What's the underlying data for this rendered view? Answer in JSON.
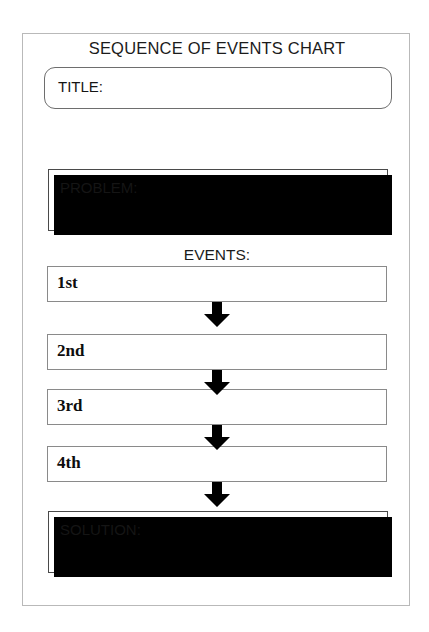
{
  "document": {
    "heading": "SEQUENCE OF EVENTS CHART",
    "background_color": "#ffffff",
    "frame_border_color": "#b9b9b9",
    "ink_color": "#000000"
  },
  "title_field": {
    "label": "TITLE:",
    "value": "",
    "placeholder": ""
  },
  "problem_field": {
    "label": "PROBLEM:",
    "value": "",
    "placeholder": ""
  },
  "events_section": {
    "label": "EVENTS:",
    "items": [
      {
        "ordinal": "1st",
        "value": "",
        "placeholder": ""
      },
      {
        "ordinal": "2nd",
        "value": "",
        "placeholder": ""
      },
      {
        "ordinal": "3rd",
        "value": "",
        "placeholder": ""
      },
      {
        "ordinal": "4th",
        "value": "",
        "placeholder": ""
      }
    ],
    "connector_icon": "arrow-down-icon",
    "connector_count": 4
  },
  "solution_field": {
    "label": "SOLUTION:",
    "value": "",
    "placeholder": ""
  }
}
